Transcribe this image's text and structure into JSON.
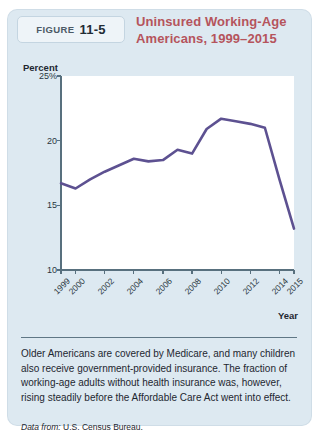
{
  "figure": {
    "tag_word": "FIGURE",
    "tag_number": "11-5",
    "title": "Uninsured Working-Age Americans, 1999–2015",
    "title_line1": "Uninsured Working-Age",
    "title_line2": "Americans, 1999–2015",
    "caption": "Older Americans are covered by Medicare, and many children also receive government-provided insurance. The fraction of working-age adults without health insurance was, however, rising steadily before the Affordable Care Act went into effect.",
    "source_lead": "Data from:",
    "source_text": "U.S. Census Bureau.",
    "colors": {
      "card_background": "#dde9f1",
      "title": "#b5545c",
      "line": "#5d5191",
      "plot_background": "#ffffff",
      "axis": "#58707e"
    }
  },
  "chart_data": {
    "type": "line",
    "title": "Uninsured Working-Age Americans, 1999–2015",
    "xlabel": "Year",
    "ylabel": "Percent",
    "ylim": [
      10,
      25
    ],
    "xlim": [
      1999,
      2015
    ],
    "yticks": [
      10,
      15,
      20,
      25
    ],
    "ytick_labels": [
      "10",
      "15",
      "20",
      "25%"
    ],
    "xticks": [
      1999,
      2000,
      2002,
      2004,
      2006,
      2008,
      2010,
      2012,
      2014,
      2015
    ],
    "xtick_labels": [
      "1999",
      "2000",
      "2002",
      "2004",
      "2006",
      "2008",
      "2010",
      "2012",
      "2014",
      "2015"
    ],
    "grid": false,
    "legend": false,
    "series": [
      {
        "name": "Uninsured working-age Americans",
        "color": "#5d5191",
        "x": [
          1999,
          2000,
          2001,
          2002,
          2003,
          2004,
          2005,
          2006,
          2007,
          2008,
          2009,
          2010,
          2011,
          2012,
          2013,
          2014,
          2015
        ],
        "values": [
          16.7,
          16.3,
          17.0,
          17.6,
          18.1,
          18.6,
          18.4,
          18.5,
          19.3,
          19.0,
          20.9,
          21.7,
          21.5,
          21.3,
          21.0,
          17.0,
          13.2
        ]
      }
    ]
  }
}
